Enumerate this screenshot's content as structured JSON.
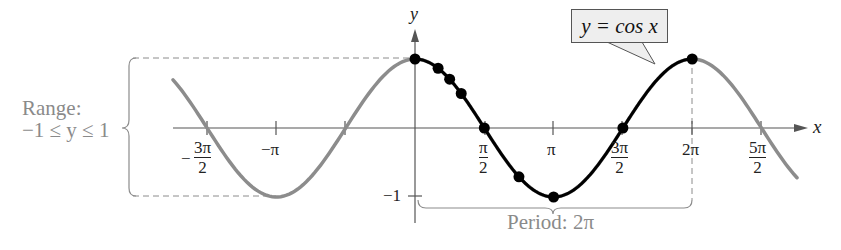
{
  "chart_data": {
    "type": "line",
    "title": "y = cos x",
    "function": "cos(x)",
    "xlabel": "x",
    "ylabel": "y",
    "xlim_radians": [
      -5.14,
      8.71
    ],
    "ylim": [
      -1,
      1
    ],
    "grid": false,
    "x_tick_labels": [
      "-3π/2",
      "-π",
      "π/2",
      "π",
      "3π/2",
      "2π",
      "5π/2"
    ],
    "x_ticks_radians": [
      -4.712,
      -3.1416,
      -1.5708,
      1.5708,
      3.1416,
      4.712,
      6.2832,
      7.854
    ],
    "y_tick_labels": [
      "-1"
    ],
    "series": [
      {
        "name": "cos x (one period, highlighted)",
        "color": "#000000",
        "x_range": [
          0,
          6.2832
        ]
      },
      {
        "name": "cos x (extension)",
        "color": "#8c8c8c",
        "x_range": [
          -4.9,
          8.7
        ]
      }
    ],
    "key_points": [
      {
        "x": "0",
        "y": 1
      },
      {
        "x": "π/6",
        "y": 0.866
      },
      {
        "x": "π/4",
        "y": 0.707
      },
      {
        "x": "π/3",
        "y": 0.5
      },
      {
        "x": "π/2",
        "y": 0
      },
      {
        "x": "3π/4",
        "y": -0.707
      },
      {
        "x": "π",
        "y": -1
      },
      {
        "x": "3π/2",
        "y": 0
      },
      {
        "x": "2π",
        "y": 1
      }
    ],
    "annotations": [
      {
        "text": "Range: −1 ≤ y ≤ 1",
        "type": "brace-left"
      },
      {
        "text": "Period: 2π",
        "type": "brace-bottom"
      },
      {
        "text": "y = cos x",
        "type": "callout"
      }
    ]
  },
  "labels": {
    "y_axis": "y",
    "x_axis": "x",
    "callout": "y = cos x",
    "range_title": "Range:",
    "range_value": "−1 ≤ y ≤ 1",
    "period": "Period: 2π",
    "y_tick_neg1": "−1",
    "tick_neg_3pi_2_num": "3π",
    "tick_neg_3pi_2_den": "2",
    "tick_neg_pi": "−π",
    "tick_pi_2_num": "π",
    "tick_pi_2_den": "2",
    "tick_pi": "π",
    "tick_3pi_2_num": "3π",
    "tick_3pi_2_den": "2",
    "tick_2pi": "2π",
    "tick_5pi_2_num": "5π",
    "tick_5pi_2_den": "2",
    "minus": "−"
  },
  "colors": {
    "curve_highlight": "#000000",
    "curve_extension": "#8c8c8c",
    "axis": "#555555",
    "annotation_text": "#8a8a8a",
    "callout_fill": "#eeeeee"
  }
}
